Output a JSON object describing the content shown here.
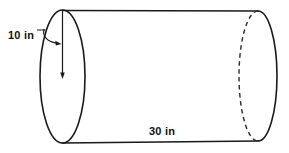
{
  "figure": {
    "type": "cylinder-diagram",
    "shape_name": "cylinder",
    "stroke_color": "#1a1a1a",
    "hidden_edge_color": "#2b2b2b",
    "background_color": "#ffffff",
    "labels": {
      "radius": "10 in",
      "length": "30 in"
    },
    "dimensions": [
      {
        "name": "radius",
        "value": 10,
        "unit": "in",
        "label": "10 in"
      },
      {
        "name": "length",
        "value": 30,
        "unit": "in",
        "label": "30 in"
      }
    ]
  }
}
